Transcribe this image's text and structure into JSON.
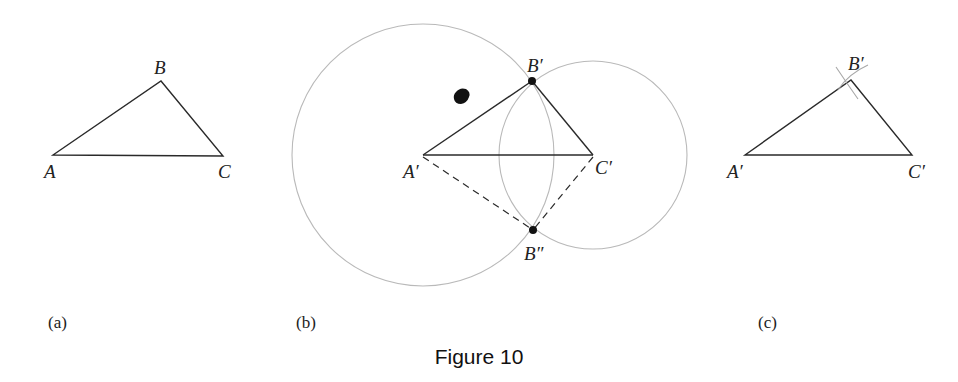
{
  "figure": {
    "caption": "Figure 10",
    "panels": [
      {
        "id": "a",
        "panel_label": "(a)",
        "vertex_labels": {
          "A": "A",
          "B": "B",
          "C": "C"
        },
        "description": "Original triangle ABC"
      },
      {
        "id": "b",
        "panel_label": "(b)",
        "vertex_labels": {
          "A": "A′",
          "B1": "B′",
          "B2": "B″",
          "C": "C′"
        },
        "description": "Construction: circle centered at A′ with radius AB, circle centered at C′ with radius CB; intersections B′ and B″",
        "dashed_triangle": "A′B″C′"
      },
      {
        "id": "c",
        "panel_label": "(c)",
        "vertex_labels": {
          "A": "A′",
          "B": "B′",
          "C": "C′"
        },
        "description": "Copied triangle A′B′C′ with construction arcs at B′"
      }
    ]
  }
}
